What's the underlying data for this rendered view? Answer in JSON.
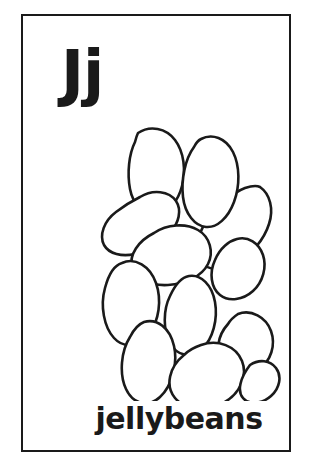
{
  "page": {
    "type": "alphabet-flashcard",
    "background_color": "#ffffff",
    "ink_color": "#1a1a1a"
  },
  "frame": {
    "name": "card-border",
    "border_color": "#1a1a1a",
    "border_width_px": 2
  },
  "letter": {
    "pair": "Jj",
    "uppercase": "J",
    "lowercase": "j",
    "color": "#1a1a1a"
  },
  "illustration": {
    "subject": "jellybeans",
    "style": "black-and-white line art outline, uncolored",
    "item_count": 12,
    "stroke_color": "#1a1a1a",
    "fill_color": "#ffffff"
  },
  "caption": {
    "word": "jellybeans",
    "color": "#1a1a1a"
  }
}
